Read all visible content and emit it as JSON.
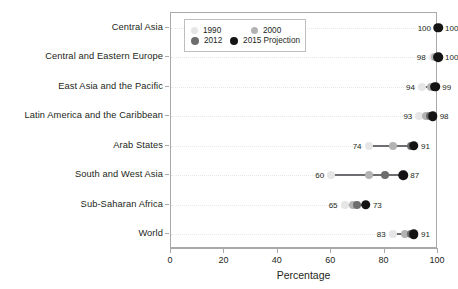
{
  "chart_data": {
    "type": "scatter",
    "title": "",
    "xlabel": "Percentage",
    "ylabel": "",
    "xlim": [
      0,
      100
    ],
    "xticks": [
      0,
      20,
      40,
      60,
      80,
      100
    ],
    "grid": false,
    "legend_position": "top-left-inside",
    "categories": [
      "Central Asia",
      "Central and Eastern Europe",
      "East Asia and the Pacific",
      "Latin America and the Caribbean",
      "Arab States",
      "South and West Asia",
      "Sub-Saharan Africa",
      "World"
    ],
    "series": [
      {
        "name": "1990",
        "color": "#e6e6e6",
        "values": [
          100,
          98,
          94,
          93,
          74,
          60,
          65,
          83
        ]
      },
      {
        "name": "2000",
        "color": "#b3b3b3",
        "values": [
          100,
          99,
          97.5,
          95.5,
          83,
          74,
          68,
          87.5
        ]
      },
      {
        "name": "2012",
        "color": "#6d6d6d",
        "values": [
          100,
          99.5,
          98.5,
          97,
          90,
          80,
          69.5,
          90
        ]
      },
      {
        "name": "2015 Projection",
        "color": "#141414",
        "values": [
          100,
          100,
          99,
          98,
          91,
          87,
          73,
          91
        ]
      }
    ],
    "point_labels": [
      {
        "category": "Central Asia",
        "left": "100",
        "right": "100"
      },
      {
        "category": "Central and Eastern Europe",
        "left": "98",
        "right": "100"
      },
      {
        "category": "East Asia and the Pacific",
        "left": "94",
        "right": "99"
      },
      {
        "category": "Latin America and the Caribbean",
        "left": "93",
        "right": "98"
      },
      {
        "category": "Arab States",
        "left": "74",
        "right": "91"
      },
      {
        "category": "South and West Asia",
        "left": "60",
        "right": "87"
      },
      {
        "category": "Sub-Saharan Africa",
        "left": "65",
        "right": "73"
      },
      {
        "category": "World",
        "left": "83",
        "right": "91"
      }
    ]
  },
  "legend": {
    "entries": [
      {
        "label": "1990",
        "color": "#e6e6e6"
      },
      {
        "label": "2000",
        "color": "#b3b3b3"
      },
      {
        "label": "2012",
        "color": "#6d6d6d"
      },
      {
        "label": "2015 Projection",
        "color": "#141414"
      }
    ]
  },
  "axis": {
    "x_title": "Percentage",
    "x_tick_labels": [
      "0",
      "20",
      "40",
      "60",
      "80",
      "100"
    ]
  },
  "colors": {
    "frame": "#a7a9ac",
    "connector": "#6d6e71",
    "guide": "#e8e7e6",
    "text": "#231f20",
    "background": "#ffffff"
  }
}
